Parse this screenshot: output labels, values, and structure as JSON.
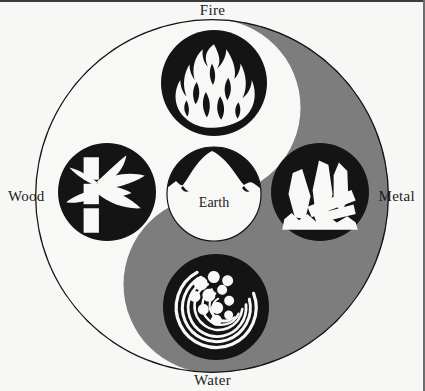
{
  "figure": {
    "center_label": "Earth",
    "labels": {
      "top": "Fire",
      "left": "Wood",
      "right": "Metal",
      "bottom": "Water"
    },
    "elements": [
      {
        "id": "fire",
        "label": "Fire",
        "icon": "flame-icon",
        "position": "top",
        "disc_fill": "#141414",
        "motif_fill": "#f7f7f6"
      },
      {
        "id": "wood",
        "label": "Wood",
        "icon": "bamboo-icon",
        "position": "left",
        "disc_fill": "#141414",
        "motif_fill": "#f7f7f6"
      },
      {
        "id": "earth",
        "label": "Earth",
        "icon": "mountain-icon",
        "position": "center",
        "disc_fill": "#f7f7f6",
        "motif_fill": "#141414"
      },
      {
        "id": "metal",
        "label": "Metal",
        "icon": "crystal-icon",
        "position": "right",
        "disc_fill": "#141414",
        "motif_fill": "#f7f7f6"
      },
      {
        "id": "water",
        "label": "Water",
        "icon": "wave-icon",
        "position": "bottom",
        "disc_fill": "#141414",
        "motif_fill": "#f7f7f6"
      }
    ],
    "colors": {
      "page_background": "#f7f7f6",
      "yin_light": "#f8f8f7",
      "yang_gray": "#7d7d7d",
      "outline": "#141414",
      "text": "#1b1b1b",
      "border_line": "#3b3b3b"
    },
    "geometry": {
      "outer_circle": {
        "cx": 212,
        "cy": 196,
        "r": 178
      },
      "discs": [
        {
          "id": "fire",
          "cx": 214,
          "cy": 83,
          "r": 53
        },
        {
          "id": "wood",
          "cx": 107,
          "cy": 192,
          "r": 49
        },
        {
          "id": "earth",
          "cx": 214,
          "cy": 194,
          "r": 47
        },
        {
          "id": "metal",
          "cx": 320,
          "cy": 192,
          "r": 49
        },
        {
          "id": "water",
          "cx": 216,
          "cy": 307,
          "r": 52
        }
      ]
    }
  }
}
